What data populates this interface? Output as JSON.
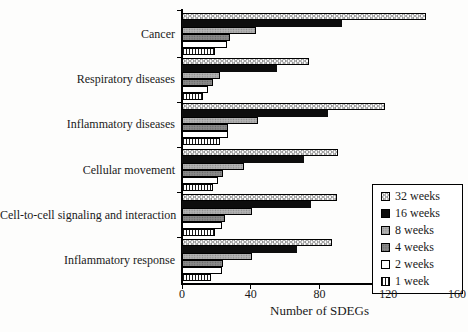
{
  "chart_data": {
    "type": "bar",
    "orientation": "horizontal",
    "title": "",
    "xlabel": "Number of SDEGs",
    "xlim": [
      0,
      160
    ],
    "xticks": [
      0,
      40,
      80,
      120,
      160
    ],
    "grid": false,
    "legend_position": "right-bottom-boxed",
    "categories": [
      "Cancer",
      "Respiratory diseases",
      "Inflammatory diseases",
      "Cellular movement",
      "Cell-to-cell signaling and interaction",
      "Inflammatory response"
    ],
    "series": [
      {
        "name": "32 weeks",
        "pattern": "dots",
        "values": [
          142,
          74,
          118,
          91,
          90,
          87
        ]
      },
      {
        "name": "16 weeks",
        "pattern": "solid-black",
        "values": [
          93,
          55,
          85,
          71,
          75,
          67
        ]
      },
      {
        "name": "8 weeks",
        "pattern": "gray-dotted",
        "values": [
          43,
          22,
          44,
          36,
          41,
          41
        ]
      },
      {
        "name": "4 weeks",
        "pattern": "dark-gray-dotted",
        "values": [
          28,
          18,
          27,
          24,
          25,
          24
        ]
      },
      {
        "name": "2 weeks",
        "pattern": "white",
        "values": [
          26,
          15,
          27,
          21,
          23,
          23
        ]
      },
      {
        "name": "1 week",
        "pattern": "vertical-stripes",
        "values": [
          19,
          12,
          22,
          18,
          19,
          17
        ]
      }
    ]
  }
}
